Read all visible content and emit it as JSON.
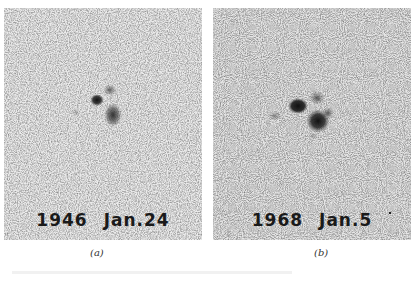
{
  "figure": {
    "panels": [
      {
        "id": "a",
        "year": "1946",
        "date": "Jan.24",
        "caption": "(a)"
      },
      {
        "id": "b",
        "year": "1968",
        "date": "Jan.5",
        "caption": "(b)"
      }
    ],
    "colors": {
      "background": "#ffffff",
      "plate": "#e9e9e9",
      "spot": "#1e1e1e",
      "label": "#1a1a1a"
    }
  }
}
